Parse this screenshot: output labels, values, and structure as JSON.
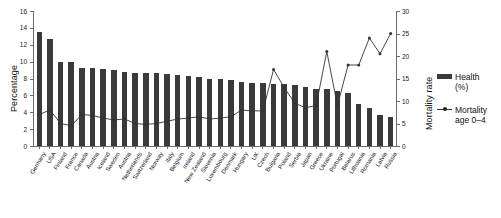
{
  "chart_data": {
    "type": "bar",
    "title": "",
    "subtitle": "",
    "xlabel": "",
    "ylabel": "Percentage",
    "y2label": "Mortality rate",
    "ylim": [
      0,
      16
    ],
    "y2lim": [
      0,
      30
    ],
    "ytick_labels": [
      "0",
      "2",
      "4",
      "6",
      "8",
      "10",
      "12",
      "14",
      "16"
    ],
    "y2tick_labels": [
      "0",
      "5",
      "10",
      "15",
      "20",
      "25",
      "30"
    ],
    "grid": false,
    "legend_position": "right",
    "categories": [
      "Germany",
      "USA",
      "Finland",
      "France",
      "Canada",
      "Austria",
      "Iceland",
      "Sweden",
      "Austria",
      "Netherlands",
      "Switzerland",
      "Norway",
      "Italy",
      "Belgium",
      "Ireland",
      "New Zealand",
      "Slovenia",
      "Luxembourg",
      "Denmark",
      "Hungary",
      "UK",
      "Czech",
      "Bulgaria",
      "Poland",
      "Serbia",
      "Japan",
      "Greece",
      "Ukraine",
      "Portugal",
      "Belarus",
      "Lithuania",
      "Romania",
      "Latvia",
      "Russia"
    ],
    "series": [
      {
        "name": "Health (%)",
        "axis": "left",
        "render": "bar",
        "color": "#3a3a3a",
        "values": [
          13.5,
          12.7,
          10.0,
          10.0,
          9.2,
          9.2,
          9.1,
          9.0,
          8.8,
          8.7,
          8.7,
          8.6,
          8.5,
          8.4,
          8.3,
          8.2,
          8.0,
          7.9,
          7.8,
          7.6,
          7.5,
          7.5,
          7.4,
          7.3,
          7.2,
          7.0,
          6.8,
          6.7,
          6.5,
          6.3,
          5.0,
          4.5,
          3.7,
          3.4
        ]
      },
      {
        "name": "Mortality age 0–4",
        "axis": "right",
        "render": "line",
        "color": "#333333",
        "marker": "dot",
        "values": [
          7.0,
          8.0,
          5.0,
          4.5,
          7.0,
          6.8,
          6.2,
          5.8,
          6.0,
          5.0,
          4.8,
          5.0,
          5.5,
          6.0,
          6.2,
          6.5,
          6.0,
          6.2,
          6.5,
          8.0,
          7.8,
          7.8,
          17.0,
          13.0,
          9.5,
          8.5,
          9.0,
          21.0,
          9.0,
          18.0,
          18.0,
          24.0,
          20.5,
          25.0
        ]
      }
    ],
    "legend": [
      {
        "label_line1": "Health",
        "label_line2": "(%)",
        "marker": "bar"
      },
      {
        "label_line1": "Mortality",
        "label_line2": "age 0–4",
        "marker": "line-dot"
      }
    ]
  }
}
